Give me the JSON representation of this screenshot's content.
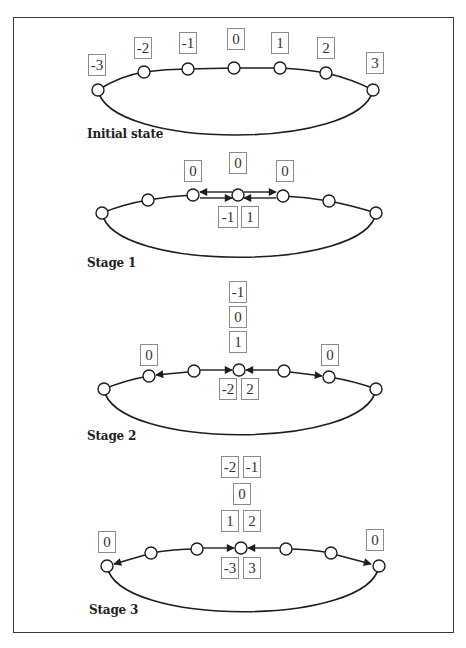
{
  "stages": [
    {
      "label": "Initial state",
      "nodes": [
        -3,
        -2,
        -1,
        0,
        1,
        2,
        3
      ],
      "node_labels": [
        "-3",
        "-2",
        "-1",
        "0",
        "1",
        "2",
        "3"
      ]
    },
    {
      "label": "Stage 1",
      "above": {
        "left": "0",
        "center": "0",
        "right": "0"
      },
      "below_center": [
        "-1",
        "1"
      ]
    },
    {
      "label": "Stage 2",
      "above_center_stack": [
        "-1",
        "0",
        "1"
      ],
      "above_left": "0",
      "above_right": "0",
      "below_center": [
        "-2",
        "2"
      ]
    },
    {
      "label": "Stage 3",
      "above_center_rows": [
        [
          "-2",
          "-1"
        ],
        [
          "0"
        ],
        [
          "1",
          "2"
        ]
      ],
      "above_far_left": "0",
      "above_far_right": "0",
      "below_center": [
        "-3",
        "3"
      ]
    }
  ],
  "colors": {
    "line": "#1e1e1e",
    "box_border": "#8a8a8a",
    "frame": "#3a3a3a",
    "text": "#333333"
  }
}
